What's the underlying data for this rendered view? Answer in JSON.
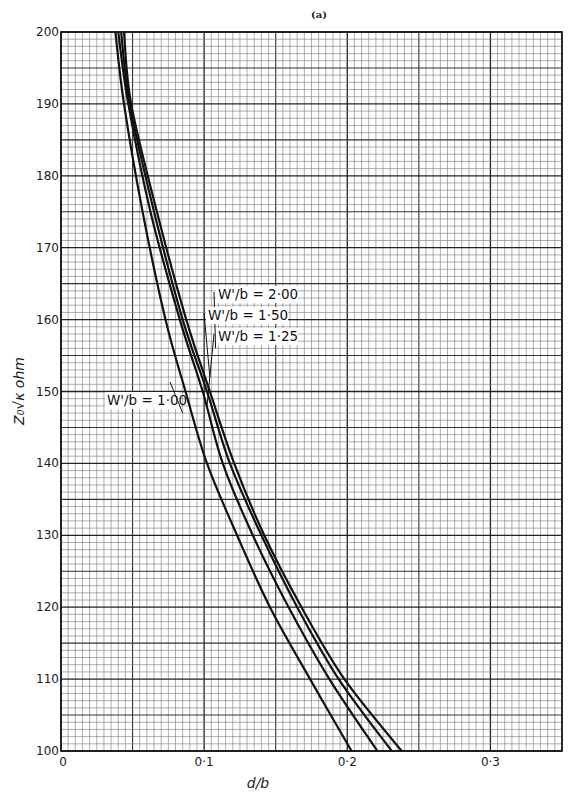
{
  "chart_data": {
    "type": "line",
    "title": "(a)",
    "xlabel": "d/b",
    "ylabel": "Z₀√κ ohm",
    "xlim": [
      0,
      0.35
    ],
    "ylim": [
      100,
      200
    ],
    "grid": true,
    "x_ticks": [
      0,
      0.1,
      0.2,
      0.3
    ],
    "x_tick_labels": [
      "0",
      "0·1",
      "0·2",
      "0·3"
    ],
    "y_ticks": [
      100,
      110,
      120,
      130,
      140,
      150,
      160,
      170,
      180,
      190,
      200
    ],
    "y_tick_labels": [
      "100",
      "110",
      "120",
      "130",
      "140",
      "150",
      "160",
      "170",
      "180",
      "190",
      "200"
    ],
    "series": [
      {
        "name": "W'/b = 1·00",
        "label": "W'/b = 1·00",
        "points": [
          [
            0.038,
            200
          ],
          [
            0.044,
            190
          ],
          [
            0.057,
            175
          ],
          [
            0.073,
            160
          ],
          [
            0.087,
            150
          ],
          [
            0.102,
            140
          ],
          [
            0.123,
            130
          ],
          [
            0.146,
            120
          ],
          [
            0.174,
            110
          ],
          [
            0.203,
            100
          ]
        ]
      },
      {
        "name": "W'/b = 1·25",
        "label": "W'/b = 1·25",
        "points": [
          [
            0.04,
            200
          ],
          [
            0.047,
            190
          ],
          [
            0.0625,
            175
          ],
          [
            0.083,
            160
          ],
          [
            0.099,
            150
          ],
          [
            0.113,
            140
          ],
          [
            0.134,
            130
          ],
          [
            0.159,
            120
          ],
          [
            0.1875,
            110
          ],
          [
            0.221,
            100
          ]
        ]
      },
      {
        "name": "W'/b = 1·50",
        "label": "W'/b = 1·50",
        "points": [
          [
            0.042,
            200
          ],
          [
            0.048,
            190
          ],
          [
            0.065,
            175
          ],
          [
            0.085,
            160
          ],
          [
            0.102,
            150
          ],
          [
            0.118,
            140
          ],
          [
            0.14,
            130
          ],
          [
            0.165,
            120
          ],
          [
            0.194,
            110
          ],
          [
            0.231,
            100
          ]
        ]
      },
      {
        "name": "W'/b = 2·00",
        "label": "W'/b = 2·00",
        "points": [
          [
            0.044,
            200
          ],
          [
            0.049,
            190
          ],
          [
            0.067,
            175
          ],
          [
            0.0875,
            160
          ],
          [
            0.104,
            150
          ],
          [
            0.121,
            140
          ],
          [
            0.142,
            130
          ],
          [
            0.168,
            120
          ],
          [
            0.198,
            110
          ],
          [
            0.238,
            100
          ]
        ]
      }
    ],
    "annotations": [
      {
        "text": "W'/b = 2·00",
        "series": 3,
        "anchor_x": 0.108,
        "anchor_y": 156
      },
      {
        "text": "W'/b = 1·50",
        "series": 2,
        "anchor_x": 0.104,
        "anchor_y": 152
      },
      {
        "text": "W'/b = 1·25",
        "series": 1,
        "anchor_x": 0.102,
        "anchor_y": 148
      },
      {
        "text": "W'/b = 1·00",
        "series": 0,
        "anchor_x": 0.085,
        "anchor_y": 147
      }
    ],
    "colors": {
      "line": "#111111",
      "grid": "#555555",
      "frame": "#111111"
    }
  }
}
